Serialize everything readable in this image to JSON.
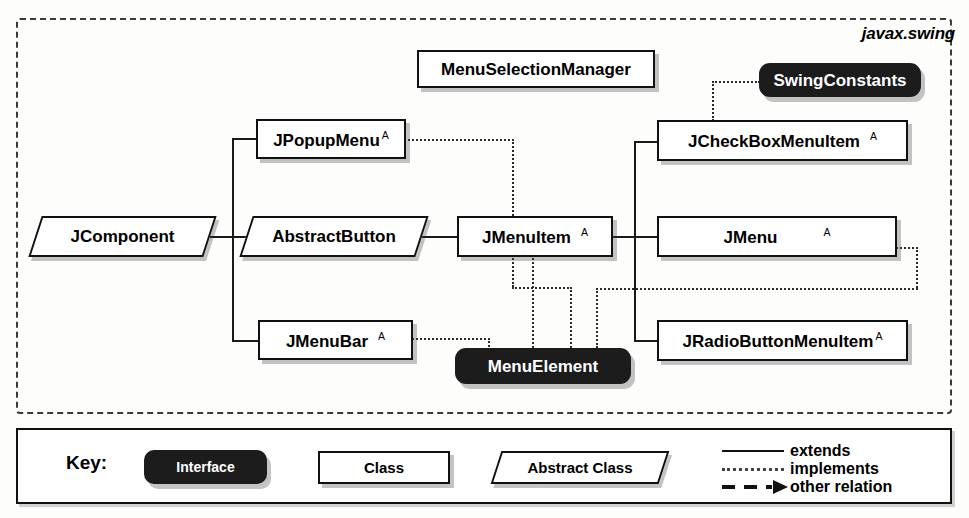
{
  "diagram": {
    "package_label": "javax.swing",
    "nodes": [
      {
        "id": "jcomponent",
        "label": "JComponent",
        "kind": "abstract-class",
        "abstract_marker": ""
      },
      {
        "id": "jpopupmenu",
        "label": "JPopupMenu",
        "kind": "class",
        "abstract_marker": "A"
      },
      {
        "id": "abstractbutton",
        "label": "AbstractButton",
        "kind": "abstract-class",
        "abstract_marker": ""
      },
      {
        "id": "jmenubar",
        "label": "JMenuBar",
        "kind": "class",
        "abstract_marker": "A"
      },
      {
        "id": "jmenuitem",
        "label": "JMenuItem",
        "kind": "class",
        "abstract_marker": "A"
      },
      {
        "id": "jcheckboxmenuitem",
        "label": "JCheckBoxMenuItem",
        "kind": "class",
        "abstract_marker": "A"
      },
      {
        "id": "jmenu",
        "label": "JMenu",
        "kind": "class",
        "abstract_marker": "A"
      },
      {
        "id": "jradiobuttonmenuitem",
        "label": "JRadioButtonMenuItem",
        "kind": "class",
        "abstract_marker": "A"
      },
      {
        "id": "menuselectionmanager",
        "label": "MenuSelectionManager",
        "kind": "class",
        "abstract_marker": ""
      },
      {
        "id": "swingconstants",
        "label": "SwingConstants",
        "kind": "interface",
        "abstract_marker": ""
      },
      {
        "id": "menuelement",
        "label": "MenuElement",
        "kind": "interface",
        "abstract_marker": ""
      }
    ],
    "relations": [
      {
        "from": "jcomponent",
        "to": "jpopupmenu",
        "type": "extends"
      },
      {
        "from": "jcomponent",
        "to": "abstractbutton",
        "type": "extends"
      },
      {
        "from": "jcomponent",
        "to": "jmenubar",
        "type": "extends"
      },
      {
        "from": "abstractbutton",
        "to": "jmenuitem",
        "type": "extends"
      },
      {
        "from": "jmenuitem",
        "to": "jcheckboxmenuitem",
        "type": "extends"
      },
      {
        "from": "jmenuitem",
        "to": "jmenu",
        "type": "extends"
      },
      {
        "from": "jmenuitem",
        "to": "jradiobuttonmenuitem",
        "type": "extends"
      },
      {
        "from": "jpopupmenu",
        "to": "menuelement",
        "type": "implements"
      },
      {
        "from": "jmenubar",
        "to": "menuelement",
        "type": "implements"
      },
      {
        "from": "jmenuitem",
        "to": "menuelement",
        "type": "implements"
      },
      {
        "from": "jmenu",
        "to": "menuelement",
        "type": "implements"
      },
      {
        "from": "jradiobuttonmenuitem",
        "to": "menuelement",
        "type": "implements"
      },
      {
        "from": "jcheckboxmenuitem",
        "to": "swingconstants",
        "type": "implements"
      }
    ]
  },
  "key": {
    "title": "Key:",
    "interface_label": "Interface",
    "class_label": "Class",
    "abstract_label": "Abstract Class",
    "lines": [
      {
        "style": "solid",
        "label": "extends"
      },
      {
        "style": "dotted",
        "label": "implements"
      },
      {
        "style": "dashed-arrow",
        "label": "other relation"
      }
    ]
  },
  "colors": {
    "interface_fill": "#1c1c1c",
    "class_fill": "#ffffff",
    "stroke": "#111111",
    "page_bg": "#fdfdfc"
  }
}
